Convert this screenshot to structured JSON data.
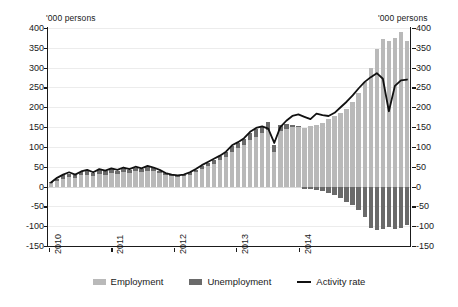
{
  "axis": {
    "unit_caption_left": "'000 persons",
    "unit_caption_right": "'000 persons",
    "y_ticks": [
      400,
      350,
      300,
      250,
      200,
      150,
      100,
      50,
      0,
      -50,
      -100,
      -150
    ],
    "y_tick_labels": [
      "400",
      "350",
      "300",
      "250",
      "200",
      "150",
      "100",
      "50",
      "0",
      "-50",
      "-100",
      "-150"
    ],
    "y_min": -150,
    "y_max": 400,
    "y_step": 50,
    "x_tick_labels": [
      "2010",
      "2011",
      "2012",
      "2013",
      "2014"
    ]
  },
  "legend": {
    "items": [
      {
        "label": "Employment",
        "marker": "swatch-light-gray",
        "color": "#b9b9b9"
      },
      {
        "label": "Unemployment",
        "marker": "swatch-dark-gray",
        "color": "#6a6a6a"
      },
      {
        "label": "Activity rate",
        "marker": "line-black",
        "color": "#111111"
      }
    ]
  },
  "colors": {
    "employment": "#b9b9b9",
    "unemployment": "#6a6a6a",
    "activity_rate": "#111111",
    "grid": "#ececec",
    "axis": "#1a1a1a",
    "background": "#ffffff"
  },
  "chart_data": {
    "type": "bar",
    "subtype": "stacked-bar-with-line-overlay",
    "title": "",
    "xlabel": "",
    "ylabel": "'000 persons",
    "ylim": [
      -150,
      400
    ],
    "ytick_step": 50,
    "grid": true,
    "legend_position": "bottom-center",
    "x_axis_type": "monthly",
    "x_tick_years": [
      "2010",
      "2011",
      "2012",
      "2013",
      "2014"
    ],
    "x_start": "2010-01",
    "x_end": "2014-12",
    "x": [
      "2010-01",
      "2010-02",
      "2010-03",
      "2010-04",
      "2010-05",
      "2010-06",
      "2010-07",
      "2010-08",
      "2010-09",
      "2010-10",
      "2010-11",
      "2010-12",
      "2011-01",
      "2011-02",
      "2011-03",
      "2011-04",
      "2011-05",
      "2011-06",
      "2011-07",
      "2011-08",
      "2011-09",
      "2011-10",
      "2011-11",
      "2011-12",
      "2012-01",
      "2012-02",
      "2012-03",
      "2012-04",
      "2012-05",
      "2012-06",
      "2012-07",
      "2012-08",
      "2012-09",
      "2012-10",
      "2012-11",
      "2012-12",
      "2013-01",
      "2013-02",
      "2013-03",
      "2013-04",
      "2013-05",
      "2013-06",
      "2013-07",
      "2013-08",
      "2013-09",
      "2013-10",
      "2013-11",
      "2013-12",
      "2014-01",
      "2014-02",
      "2014-03",
      "2014-04",
      "2014-05",
      "2014-06",
      "2014-07",
      "2014-08",
      "2014-09",
      "2014-10",
      "2014-11",
      "2014-12"
    ],
    "series": [
      {
        "name": "Employment",
        "type": "bar",
        "stack": "total",
        "color": "#b9b9b9",
        "values": [
          8,
          14,
          20,
          24,
          22,
          28,
          30,
          26,
          32,
          30,
          34,
          32,
          36,
          34,
          38,
          36,
          40,
          38,
          34,
          30,
          26,
          24,
          26,
          30,
          36,
          44,
          52,
          58,
          66,
          74,
          88,
          96,
          104,
          118,
          126,
          134,
          142,
          86,
          140,
          146,
          150,
          152,
          148,
          152,
          156,
          160,
          170,
          178,
          186,
          196,
          214,
          236,
          264,
          300,
          348,
          372,
          366,
          374,
          390,
          368
        ]
      },
      {
        "name": "Unemployment",
        "type": "bar",
        "stack": "total",
        "color": "#6a6a6a",
        "values": [
          4,
          6,
          8,
          8,
          6,
          8,
          10,
          8,
          10,
          8,
          10,
          8,
          10,
          8,
          10,
          8,
          10,
          8,
          6,
          4,
          4,
          4,
          4,
          6,
          6,
          8,
          8,
          10,
          10,
          12,
          14,
          14,
          16,
          18,
          18,
          20,
          22,
          18,
          16,
          12,
          6,
          2,
          -6,
          -6,
          -10,
          -12,
          -16,
          -22,
          -30,
          -38,
          -46,
          -58,
          -78,
          -104,
          -110,
          -106,
          -102,
          -106,
          -104,
          -96
        ]
      },
      {
        "name": "Activity rate",
        "type": "line",
        "color": "#111111",
        "values": [
          10,
          22,
          30,
          36,
          30,
          38,
          42,
          36,
          44,
          40,
          46,
          42,
          48,
          44,
          50,
          46,
          52,
          48,
          42,
          34,
          30,
          28,
          30,
          36,
          44,
          54,
          62,
          70,
          78,
          88,
          104,
          112,
          122,
          138,
          148,
          152,
          146,
          110,
          150,
          166,
          178,
          182,
          176,
          170,
          184,
          180,
          178,
          186,
          200,
          214,
          230,
          248,
          264,
          276,
          286,
          272,
          190,
          254,
          268,
          270
        ]
      }
    ]
  }
}
